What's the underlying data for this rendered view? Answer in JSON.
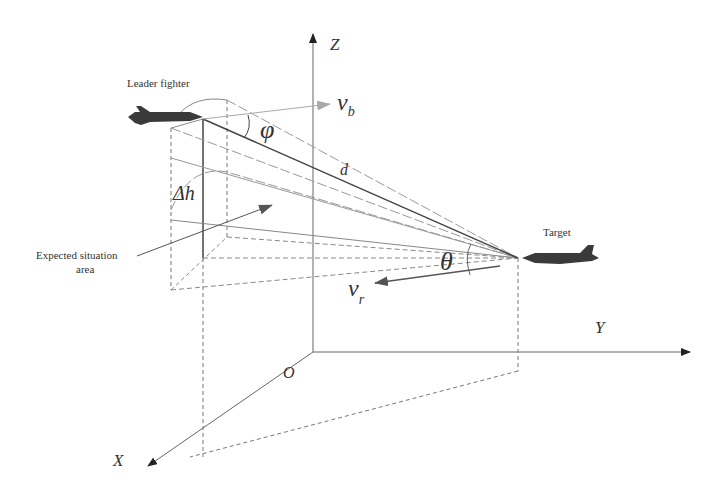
{
  "diagram": {
    "axes": {
      "z": "Z",
      "y": "Y",
      "x": "X",
      "origin": "O"
    },
    "labels": {
      "leader": "Leader fighter",
      "target": "Target",
      "expected_area_line1": "Expected situation",
      "expected_area_line2": "area",
      "vb_main": "v",
      "vb_sub": "b",
      "vr_main": "v",
      "vr_sub": "r",
      "phi": "φ",
      "theta": "θ",
      "d": "d",
      "delta_h": "Δh"
    },
    "colors": {
      "line": "#555555",
      "dashed": "#777777",
      "light_line": "#999999",
      "vb_arrow": "#aaaaaa",
      "jet": "#3a3a3a"
    }
  }
}
